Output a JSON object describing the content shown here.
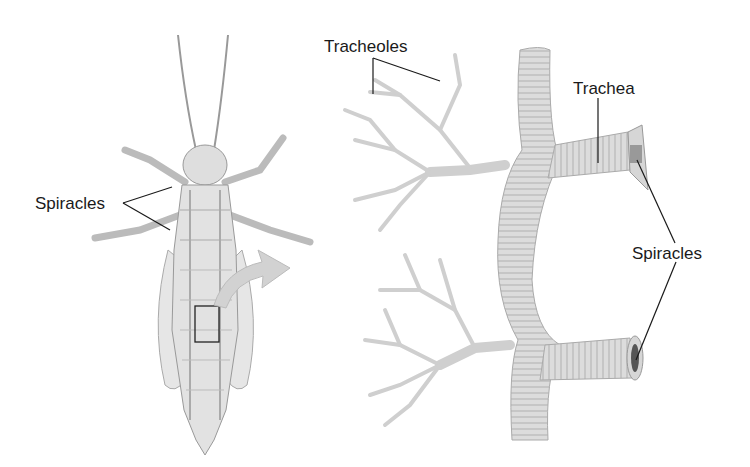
{
  "diagram": {
    "left_panel": {
      "description": "Grasshopper ventral view with tracheal network and highlighted inset box",
      "labels": [
        {
          "id": "spiracles_left",
          "text": "Spiracles"
        }
      ]
    },
    "right_panel": {
      "description": "Magnified tracheal tubes branching into tracheoles with spiracle openings",
      "labels": [
        {
          "id": "tracheoles",
          "text": "Tracheoles"
        },
        {
          "id": "trachea",
          "text": "Trachea"
        },
        {
          "id": "spiracles_right",
          "text": "Spiracles"
        }
      ]
    },
    "colors": {
      "line": "#1a1a1a",
      "tube_fill": "#dcdcdc",
      "tube_ring": "#a8a8a8",
      "body_fill": "#e2e2e2",
      "arrow": "#c8c8c8"
    }
  }
}
